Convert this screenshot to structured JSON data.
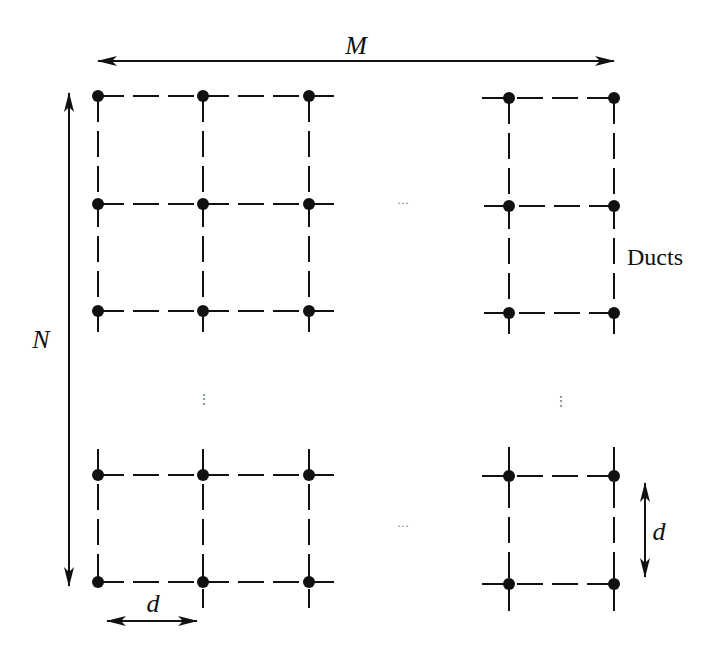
{
  "diagram": {
    "title": "",
    "labels": {
      "width_dimension": "M",
      "height_dimension": "N",
      "duct_label": "Ducts",
      "spacing_horizontal": "d",
      "spacing_vertical": "d"
    },
    "ellipsis_horizontal": "···",
    "ellipsis_vertical": "⋮",
    "colors": {
      "line": "#111111",
      "node": "#111111",
      "background": "#ffffff"
    },
    "grid": {
      "columns_left": [
        98,
        203,
        309
      ],
      "columns_right": [
        509,
        614
      ],
      "rows_top_left": [
        96,
        204,
        311
      ],
      "rows_bottom_left": [
        475,
        582
      ],
      "rows_top_right": [
        98,
        206,
        313
      ],
      "rows_bottom_right": [
        476,
        584
      ]
    }
  }
}
